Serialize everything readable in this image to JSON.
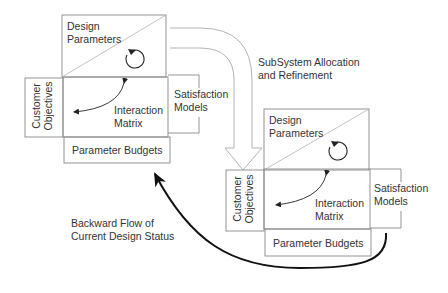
{
  "diagram": {
    "flow_arrow_label": [
      "SubSystem Allocation",
      "and Refinement"
    ],
    "backward_arrow_label": [
      "Backward Flow of",
      "Current Design Status"
    ],
    "blocks": [
      {
        "id": "system-level",
        "design_parameters": [
          "Design",
          "Parameters"
        ],
        "customer_objectives": [
          "Customer",
          "Objectives"
        ],
        "interaction_matrix": [
          "Interaction",
          "Matrix"
        ],
        "satisfaction_models": [
          "Satisfaction",
          "Models"
        ],
        "parameter_budgets": "Parameter Budgets"
      },
      {
        "id": "subsystem-level",
        "design_parameters": [
          "Design",
          "Parameters"
        ],
        "customer_objectives": [
          "Customer",
          "Objectives"
        ],
        "interaction_matrix": [
          "Interaction",
          "Matrix"
        ],
        "satisfaction_models": [
          "Satisfaction",
          "Models"
        ],
        "parameter_budgets": "Parameter Budgets"
      }
    ],
    "colors": {
      "box_stroke": "#888888",
      "text": "#333333",
      "backward_arrow": "#111111",
      "flow_arrow_outline": "#aaaaaa"
    }
  }
}
